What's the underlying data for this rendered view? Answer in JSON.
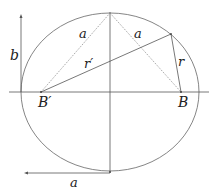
{
  "diagram": {
    "labels": {
      "b": "b",
      "a_left": "a",
      "a_right": "a",
      "r_prime": "r′",
      "r": "r",
      "B_prime": "B′",
      "B": "B",
      "a_bottom": "a"
    },
    "geometry": {
      "center": [
        110,
        92
      ],
      "semi_major_px": 89,
      "semi_minor_px": 80,
      "focus_left": [
        41,
        92
      ],
      "focus_right": [
        181,
        92
      ],
      "top_vertex": [
        110,
        13
      ],
      "point_on_ellipse": [
        171,
        34
      ]
    },
    "colors": {
      "stroke": "#555555",
      "dotted": "#888888",
      "text": "#222222"
    }
  }
}
